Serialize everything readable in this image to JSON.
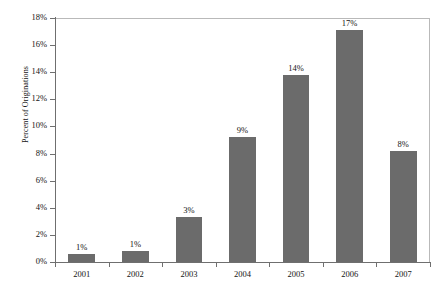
{
  "chart_data": {
    "type": "bar",
    "title": "",
    "xlabel": "",
    "ylabel": "Percent of Originations",
    "categories": [
      "2001",
      "2002",
      "2003",
      "2004",
      "2005",
      "2006",
      "2007"
    ],
    "values": [
      0.6,
      0.8,
      3.3,
      9.2,
      13.8,
      17.1,
      8.2
    ],
    "data_labels": [
      "1%",
      "1%",
      "3%",
      "9%",
      "14%",
      "17%",
      "8%"
    ],
    "ylim": [
      0,
      18
    ],
    "ytick_values": [
      0,
      2,
      4,
      6,
      8,
      10,
      12,
      14,
      16,
      18
    ],
    "ytick_labels": [
      "0%",
      "2%",
      "4%",
      "6%",
      "8%",
      "10%",
      "12%",
      "14%",
      "16%",
      "18%"
    ],
    "grid": false,
    "legend": "none",
    "bar_color": "#6b6b6b",
    "axis_color": "#6f6f6f",
    "plot_border_color": "#b9b9b9",
    "background_color": "#ffffff"
  }
}
